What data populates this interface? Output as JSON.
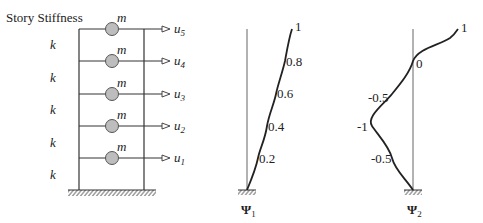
{
  "frame": {
    "title": "Story Stiffness",
    "stiffness_label": "k",
    "mass_label": "m",
    "stories": [
      {
        "k": "k",
        "m": "m",
        "u": "u",
        "sub": "5"
      },
      {
        "k": "k",
        "m": "m",
        "u": "u",
        "sub": "4"
      },
      {
        "k": "k",
        "m": "m",
        "u": "u",
        "sub": "3"
      },
      {
        "k": "k",
        "m": "m",
        "u": "u",
        "sub": "2"
      },
      {
        "k": "k",
        "m": "m",
        "u": "u",
        "sub": "1"
      }
    ],
    "mass_color": "#bdbdbd"
  },
  "mode1": {
    "symbol": "Ψ",
    "sub": "1",
    "labels": [
      "1",
      "0.8",
      "0.6",
      "0.4",
      "0.2"
    ],
    "values": [
      0,
      0.2,
      0.4,
      0.6,
      0.8,
      1
    ]
  },
  "mode2": {
    "symbol": "Ψ",
    "sub": "2",
    "labels": [
      "1",
      "0",
      "-0.5",
      "-1",
      "-0.5"
    ],
    "values": [
      0,
      -0.5,
      -1,
      -0.5,
      0,
      1
    ]
  }
}
